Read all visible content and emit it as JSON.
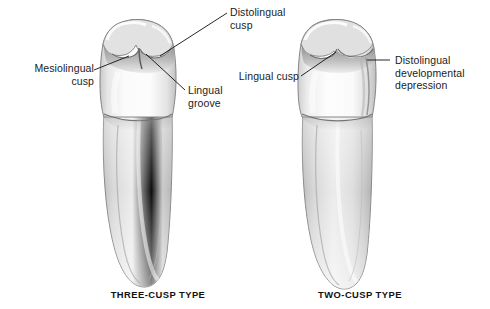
{
  "figure": {
    "background_color": "#ffffff",
    "line_color": "#1b1b1b",
    "enamel_color": "#f4f4f4",
    "root_color": "#d9d9d9",
    "shadow_color": "#9a9a9a"
  },
  "left_tooth": {
    "caption": "THREE-CUSP TYPE",
    "icon": "premolar-tooth-icon",
    "labels": [
      {
        "id": "mesiolingual-cusp",
        "lines": [
          "Mesiolingual",
          "cusp"
        ],
        "text": "Mesiolingual\ncusp",
        "align": "right"
      },
      {
        "id": "distolingual-cusp",
        "lines": [
          "Distolingual",
          "cusp"
        ],
        "text": "Distolingual\ncusp",
        "align": "left"
      },
      {
        "id": "lingual-groove",
        "lines": [
          "Lingual",
          "groove"
        ],
        "text": "Lingual\ngroove",
        "align": "left"
      }
    ]
  },
  "right_tooth": {
    "caption": "TWO-CUSP TYPE",
    "icon": "premolar-tooth-icon",
    "labels": [
      {
        "id": "lingual-cusp",
        "lines": [
          "Lingual cusp"
        ],
        "text": "Lingual cusp",
        "align": "right"
      },
      {
        "id": "distolingual-developmental-depression",
        "lines": [
          "Distolingual",
          "developmental",
          "depression"
        ],
        "text": "Distolingual\ndevelopmental\ndepression",
        "align": "left"
      }
    ]
  }
}
